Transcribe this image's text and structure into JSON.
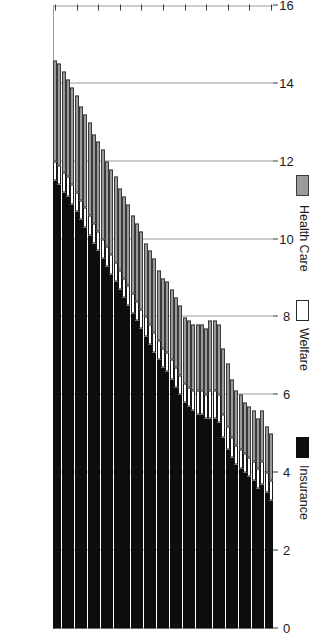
{
  "chart_data": {
    "type": "bar",
    "subtype": "stacked-horizontal",
    "orientation": "rotated-90",
    "title": "",
    "xlabel": "",
    "ylabel": "",
    "value_axis": {
      "min": 0,
      "max": 16,
      "tick_step": 2,
      "ticks": [
        0,
        2,
        4,
        6,
        8,
        10,
        12,
        14,
        16
      ],
      "tick_labels": [
        "0",
        "2",
        "4",
        "6",
        "8",
        "10",
        "12",
        "14",
        "16"
      ],
      "direction": "right-to-left",
      "grid": true
    },
    "category_axis": {
      "name": "Year",
      "min": 1980,
      "max": 2030,
      "tick_step": 5,
      "tick_labels": [
        "1980",
        "1985",
        "1990",
        "1995",
        "2000",
        "2005",
        "2010",
        "2015",
        "2020",
        "2025",
        "2030"
      ],
      "direction": "bottom-to-top"
    },
    "legend": {
      "position": "right",
      "entries": [
        {
          "label": "Insurance",
          "color": "#0d0d0d"
        },
        {
          "label": "Welfare",
          "color": "#ffffff"
        },
        {
          "label": "Health Care",
          "color": "#9b9b9b"
        }
      ]
    },
    "stack_order_from_zero": [
      "Insurance",
      "Welfare",
      "Health Care"
    ],
    "categories": [
      "1980",
      "1981",
      "1982",
      "1983",
      "1984",
      "1985",
      "1986",
      "1987",
      "1988",
      "1989",
      "1990",
      "1991",
      "1992",
      "1993",
      "1994",
      "1995",
      "1996",
      "1997",
      "1998",
      "1999",
      "2000",
      "2001",
      "2002",
      "2003",
      "2004",
      "2005",
      "2006",
      "2007",
      "2008",
      "2009",
      "2010",
      "2011",
      "2012",
      "2013",
      "2014",
      "2015",
      "2016",
      "2017",
      "2018",
      "2019",
      "2020",
      "2021",
      "2022",
      "2023",
      "2024",
      "2025",
      "2026",
      "2027",
      "2028",
      "2029",
      "2030"
    ],
    "series": [
      {
        "name": "Insurance",
        "color": "#0d0d0d",
        "values": [
          3.3,
          3.5,
          3.7,
          3.6,
          3.8,
          3.9,
          4.0,
          4.1,
          4.2,
          4.4,
          4.6,
          4.9,
          5.3,
          5.4,
          5.4,
          5.4,
          5.5,
          5.5,
          5.6,
          5.7,
          5.8,
          6.0,
          6.2,
          6.4,
          6.6,
          6.7,
          6.9,
          7.1,
          7.3,
          7.5,
          7.7,
          7.9,
          8.1,
          8.3,
          8.5,
          8.7,
          8.9,
          9.1,
          9.3,
          9.5,
          9.7,
          9.9,
          10.1,
          10.3,
          10.5,
          10.7,
          10.9,
          11.1,
          11.2,
          11.4,
          11.5
        ]
      },
      {
        "name": "Welfare",
        "color": "#ffffff",
        "values": [
          0.5,
          0.5,
          0.6,
          0.5,
          0.5,
          0.5,
          0.5,
          0.5,
          0.5,
          0.5,
          0.6,
          0.6,
          0.7,
          0.7,
          0.7,
          0.6,
          0.6,
          0.6,
          0.5,
          0.5,
          0.5,
          0.5,
          0.5,
          0.5,
          0.5,
          0.5,
          0.5,
          0.5,
          0.5,
          0.5,
          0.5,
          0.5,
          0.5,
          0.5,
          0.5,
          0.5,
          0.5,
          0.5,
          0.5,
          0.5,
          0.5,
          0.5,
          0.5,
          0.5,
          0.5,
          0.5,
          0.5,
          0.5,
          0.5,
          0.5,
          0.5
        ]
      },
      {
        "name": "Health Care",
        "color": "#9b9b9b",
        "values": [
          1.2,
          1.2,
          1.3,
          1.3,
          1.3,
          1.3,
          1.3,
          1.4,
          1.4,
          1.5,
          1.6,
          1.7,
          1.8,
          1.8,
          1.8,
          1.7,
          1.7,
          1.7,
          1.7,
          1.7,
          1.7,
          1.8,
          1.8,
          1.8,
          1.8,
          1.8,
          1.8,
          1.9,
          1.9,
          1.9,
          2.0,
          2.0,
          2.0,
          2.1,
          2.1,
          2.1,
          2.2,
          2.2,
          2.2,
          2.3,
          2.3,
          2.3,
          2.4,
          2.4,
          2.4,
          2.5,
          2.5,
          2.5,
          2.6,
          2.6,
          2.6
        ]
      }
    ]
  }
}
